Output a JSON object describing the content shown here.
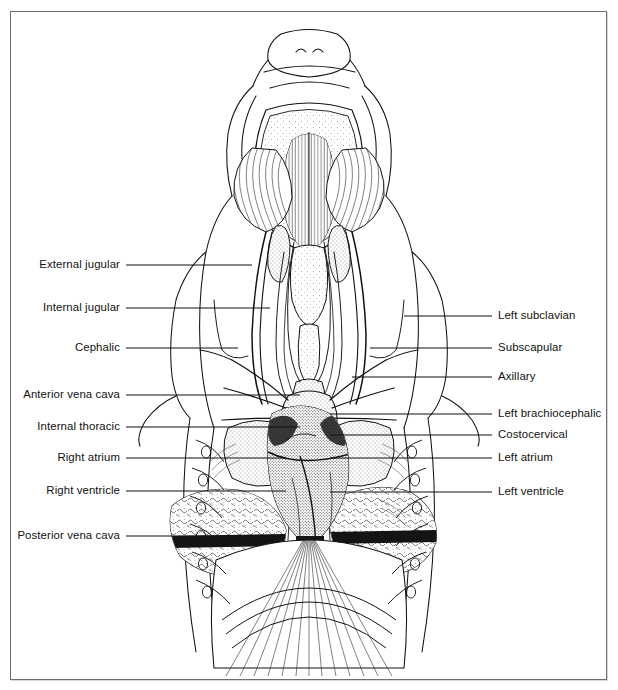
{
  "figure": {
    "view": "ventral",
    "frame_color": "#6e6e6e",
    "background_color": "#ffffff",
    "ink_color": "#111111"
  },
  "labels": {
    "left": [
      {
        "text": "External jugular",
        "y": 265,
        "leader_end_x": 252
      },
      {
        "text": "Internal jugular",
        "y": 308,
        "leader_end_x": 270
      },
      {
        "text": "Cephalic",
        "y": 348,
        "leader_end_x": 238
      },
      {
        "text": "Anterior vena cava",
        "y": 395,
        "leader_end_x": 300
      },
      {
        "text": "Internal thoracic",
        "y": 427,
        "leader_end_x": 300
      },
      {
        "text": "Right atrium",
        "y": 458,
        "leader_end_x": 286
      },
      {
        "text": "Right ventricle",
        "y": 491,
        "leader_end_x": 286
      },
      {
        "text": "Posterior vena cava",
        "y": 536,
        "leader_end_x": 266
      }
    ],
    "right": [
      {
        "text": "Left subclavian",
        "y": 316,
        "leader_start_x": 404
      },
      {
        "text": "Subscapular",
        "y": 348,
        "leader_start_x": 370
      },
      {
        "text": "Axillary",
        "y": 377,
        "leader_start_x": 352
      },
      {
        "text": "Left brachiocephalic",
        "y": 414,
        "leader_start_x": 330
      },
      {
        "text": "Costocervical",
        "y": 435,
        "leader_start_x": 330
      },
      {
        "text": "Left atrium",
        "y": 458,
        "leader_start_x": 330
      },
      {
        "text": "Left ventricle",
        "y": 492,
        "leader_start_x": 330
      }
    ],
    "left_text_right_edge": 120,
    "left_leader_start_x": 126,
    "right_text_left_edge": 498,
    "right_leader_end_x": 492
  }
}
